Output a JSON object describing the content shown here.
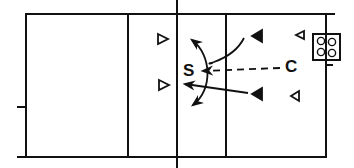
{
  "diagram": {
    "type": "volleyball-court-drill",
    "colors": {
      "line": "#111111",
      "background": "#ffffff"
    },
    "court": {
      "boundary": "rectangle",
      "net": "center-vertical-line",
      "attack_lines": 2
    },
    "labels": {
      "setter": "S",
      "coach": "C"
    },
    "players": [
      {
        "id": "p1",
        "side": "left",
        "shape": "open-triangle-right",
        "x": 160,
        "y": 40
      },
      {
        "id": "p2",
        "side": "left",
        "shape": "open-triangle-right",
        "x": 160,
        "y": 85
      },
      {
        "id": "p3",
        "side": "right",
        "shape": "filled-triangle-left",
        "x": 257,
        "y": 37
      },
      {
        "id": "p4",
        "side": "right",
        "shape": "filled-triangle-left",
        "x": 257,
        "y": 95
      },
      {
        "id": "p5",
        "side": "right",
        "shape": "open-triangle-left",
        "x": 300,
        "y": 35
      },
      {
        "id": "p6",
        "side": "right",
        "shape": "open-triangle-left",
        "x": 293,
        "y": 96
      }
    ],
    "arrows": [
      {
        "from": "C",
        "to": "S",
        "style": "dashed",
        "meaning": "ball toss"
      },
      {
        "from": "p3",
        "to": "left-of-net",
        "style": "solid-curve"
      },
      {
        "from": "p4",
        "to": "left-of-net",
        "style": "solid"
      },
      {
        "from": "S",
        "to": "up-and-down",
        "style": "solid-arc",
        "meaning": "set options"
      }
    ],
    "equipment": {
      "name": "ball-cart",
      "balls": 4
    }
  }
}
